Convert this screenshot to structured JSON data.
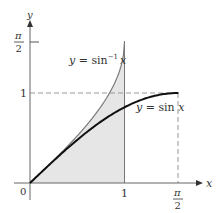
{
  "figure": {
    "axes": {
      "x_label": "x",
      "y_label": "y",
      "origin_label": "0",
      "x_ticks": [
        {
          "label": "1",
          "value": 1
        },
        {
          "label_num": "π",
          "label_den": "2",
          "value": 1.5708
        }
      ],
      "y_ticks": [
        {
          "label": "1",
          "value": 1
        },
        {
          "label_num": "π",
          "label_den": "2",
          "value": 1.5708
        }
      ]
    },
    "curves": [
      {
        "name": "arcsin",
        "label_prefix": "y = sin",
        "label_sup": "−1",
        "label_var": "x",
        "domain": [
          0,
          1
        ],
        "color": "#7a7a7a"
      },
      {
        "name": "sin",
        "label": "y = sin x",
        "domain": [
          0,
          1.5708
        ],
        "color": "#111111"
      }
    ],
    "shaded_region": {
      "description": "area under y = sin⁻¹x from 0 to 1",
      "color": "#e6e6e6"
    },
    "guides": {
      "color": "#999999"
    }
  },
  "chart_data": {
    "type": "line",
    "title": "",
    "xlabel": "x",
    "ylabel": "y",
    "xlim": [
      0,
      1.6
    ],
    "ylim": [
      0,
      1.62
    ],
    "series": [
      {
        "name": "y = sin⁻¹x",
        "x": [
          0,
          0.25,
          0.5,
          0.75,
          0.9,
          1
        ],
        "values": [
          0,
          0.2527,
          0.5236,
          0.8481,
          1.1198,
          1.5708
        ]
      },
      {
        "name": "y = sin x",
        "x": [
          0,
          0.3927,
          0.7854,
          1.1781,
          1.5708
        ],
        "values": [
          0,
          0.3827,
          0.7071,
          0.9239,
          1
        ]
      }
    ],
    "annotations": [
      "shaded region under y = sin⁻¹x for 0 ≤ x ≤ 1",
      "dashed lines at y = 1 and x = π/2",
      "vertical line at x = 1"
    ],
    "grid": false
  }
}
